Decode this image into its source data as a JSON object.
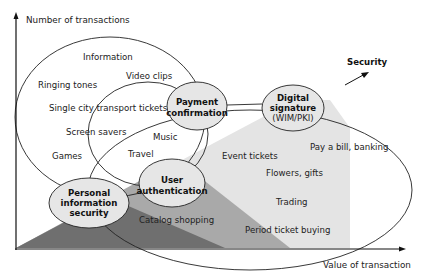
{
  "axes": {
    "y_label": "Number of transactions",
    "x_label": "Value of transaction"
  },
  "security_arrow_label": "Security",
  "nodes": {
    "payment_confirmation": [
      "Payment",
      "confirmation"
    ],
    "digital_signature": [
      "Digital",
      "signature",
      "(WIM/PKI)"
    ],
    "user_authentication": [
      "User",
      "authentication"
    ],
    "personal_information_security": [
      "Personal",
      "information",
      "security"
    ]
  },
  "large_ellipse_items": [
    "Information",
    "Video clips",
    "Ringing tones",
    "Single city transport tickets",
    "Screen savers",
    "Games"
  ],
  "middle_ellipse_items": [
    "Music",
    "Travel"
  ],
  "right_ellipse_items": [
    "Event tickets",
    "Pay a bill, banking",
    "Flowers, gifts",
    "Trading",
    "Period ticket buying",
    "Catalog shopping"
  ],
  "colors": {
    "dark_band": "#6e6e6e",
    "mid_band": "#a8a8a8",
    "light_band": "#e4e4e4",
    "node_fill": "#e6e6e6",
    "stroke": "#222222"
  }
}
